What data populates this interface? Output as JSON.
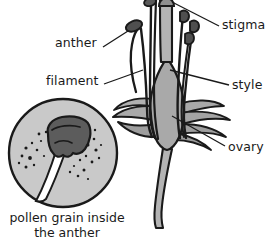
{
  "diagram": {
    "labels": [
      {
        "id": "anther",
        "text": "anther",
        "side": "left"
      },
      {
        "id": "filament",
        "text": "filament",
        "side": "left"
      },
      {
        "id": "stigma",
        "text": "stigma",
        "side": "right"
      },
      {
        "id": "style",
        "text": "style",
        "side": "right"
      },
      {
        "id": "ovary",
        "text": "ovary",
        "side": "right"
      }
    ],
    "inset": {
      "id": "pollen-inset",
      "caption_line1": "pollen grain inside",
      "caption_line2": "the anther"
    },
    "colors": {
      "outline": "#1a1a1a",
      "inset_fill": "#c9c9c9",
      "organ_fill": "#a9a9a9",
      "anther_dark": "#5a5a5a",
      "stem_fill": "#b4b4b4",
      "background": "#ffffff",
      "text": "#1a1a1a"
    }
  }
}
